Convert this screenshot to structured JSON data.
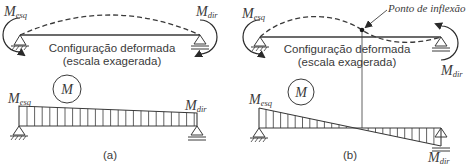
{
  "panel_a": {
    "caption": "(a)",
    "deformed_label_line1": "Configuração deformada",
    "deformed_label_line2": "(escala exagerada)",
    "moment_left": {
      "symbol": "M",
      "subscript": "esq"
    },
    "moment_right": {
      "symbol": "M",
      "subscript": "dir"
    },
    "diagram_symbol": "M"
  },
  "panel_b": {
    "caption": "(b)",
    "deformed_label_line1": "Configuração deformada",
    "deformed_label_line2": "(escala exagerada)",
    "inflection_label": "Ponto de inflexão",
    "moment_left": {
      "symbol": "M",
      "subscript": "esq"
    },
    "moment_right": {
      "symbol": "M",
      "subscript": "dir"
    },
    "diagram_symbol": "M"
  },
  "colors": {
    "line": "#3a3a3a",
    "background": "#ffffff"
  }
}
